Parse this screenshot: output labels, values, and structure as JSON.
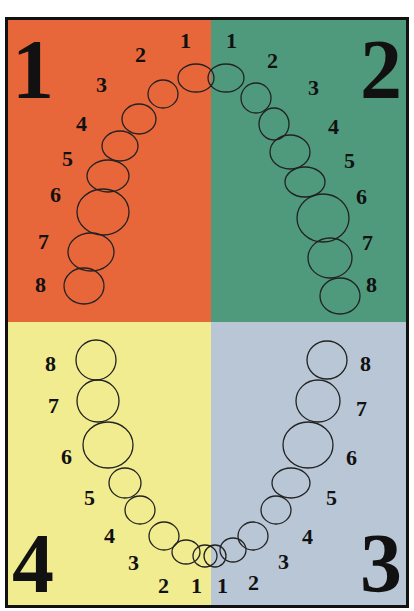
{
  "colors": {
    "q1": "#e8673a",
    "q2": "#4f9a7c",
    "q3": "#b9c6d6",
    "q4": "#f1ec8f",
    "border": "#111111"
  },
  "quadrants": [
    {
      "id": "q1",
      "label": "1",
      "position": "upper-left",
      "teeth": [
        "1",
        "2",
        "3",
        "4",
        "5",
        "6",
        "7",
        "8"
      ]
    },
    {
      "id": "q2",
      "label": "2",
      "position": "upper-right",
      "teeth": [
        "1",
        "2",
        "3",
        "4",
        "5",
        "6",
        "7",
        "8"
      ]
    },
    {
      "id": "q3",
      "label": "3",
      "position": "lower-right",
      "teeth": [
        "1",
        "2",
        "3",
        "4",
        "5",
        "6",
        "7",
        "8"
      ]
    },
    {
      "id": "q4",
      "label": "4",
      "position": "lower-left",
      "teeth": [
        "1",
        "2",
        "3",
        "4",
        "5",
        "6",
        "7",
        "8"
      ]
    }
  ]
}
